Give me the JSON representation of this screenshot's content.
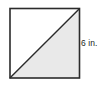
{
  "figure": {
    "type": "geometry-diagram",
    "shape_name": "square-with-diagonal",
    "canvas": {
      "width": 102,
      "height": 93,
      "background": "#ffffff"
    },
    "square": {
      "x": 10,
      "y": 8.5,
      "size": 69.5,
      "stroke_color": "#2b2b2b",
      "stroke_width": 1.6,
      "fill": "#ffffff"
    },
    "diagonal": {
      "from": "bottom-left",
      "to": "top-right",
      "stroke_color": "#2b2b2b",
      "stroke_width": 1.4
    },
    "shaded_region": {
      "name": "lower-right-triangle",
      "fill": "#e9e9e9"
    },
    "labels": [
      {
        "name": "side-length-label",
        "text": "6 in.",
        "value": 6,
        "unit": "in.",
        "side": "right",
        "color": "#231f20"
      }
    ]
  }
}
